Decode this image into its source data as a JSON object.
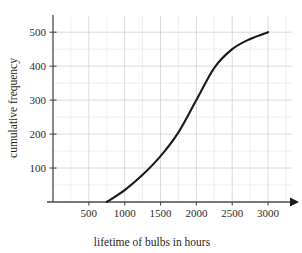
{
  "chart_data": {
    "type": "line",
    "title": "",
    "subtitle": "",
    "xlabel": "lifetime of bulbs in hours",
    "ylabel": "cumulative frequency",
    "xlim": [
      0,
      3250
    ],
    "ylim": [
      0,
      530
    ],
    "xticks": [
      500,
      1000,
      1500,
      2000,
      2500,
      3000
    ],
    "xtick_labels": [
      "500",
      "1000",
      "1500",
      "2000",
      "2500",
      "3000"
    ],
    "yticks": [
      100,
      200,
      300,
      400,
      500
    ],
    "ytick_labels": [
      "100",
      "200",
      "300",
      "400",
      "500"
    ],
    "x_minor_step": 250,
    "y_minor_step": 50,
    "grid": true,
    "legend": null,
    "legend_position": "none",
    "x_axis_arrow": true,
    "series": [
      {
        "name": "cumulative frequency",
        "color": "#1a1a1a",
        "x": [
          750,
          1000,
          1250,
          1500,
          1750,
          2000,
          2250,
          2500,
          2750,
          3000
        ],
        "values": [
          0,
          35,
          80,
          135,
          205,
          300,
          395,
          450,
          480,
          500
        ]
      }
    ],
    "annotations": []
  },
  "axis_labels": {
    "x_title": "lifetime of bulbs in hours",
    "y_title": "cumulative frequency"
  },
  "colors": {
    "curve": "#1a1a1a",
    "axis": "#4a4a4a",
    "grid_minor": "#e2e2e8",
    "grid_major": "#c9c9d2",
    "background": "#ffffff"
  }
}
